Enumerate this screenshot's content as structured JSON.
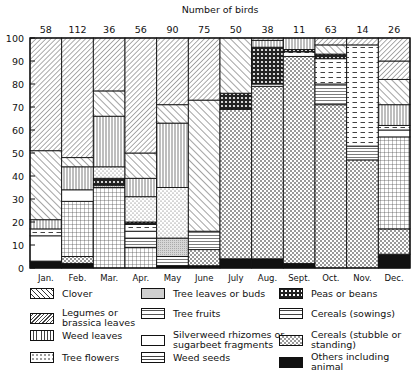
{
  "chart_data": {
    "type": "bar",
    "stacked": true,
    "title": "",
    "top_axis_label": "Number of birds",
    "xlabel": "",
    "ylabel": "",
    "ylim": [
      0,
      100
    ],
    "yticks": [
      0,
      10,
      20,
      30,
      40,
      50,
      60,
      70,
      80,
      90,
      100
    ],
    "grid": false,
    "legend_position": "bottom",
    "categories": [
      "Jan.",
      "Feb.",
      "Mar.",
      "Apr.",
      "May",
      "June",
      "July",
      "Aug.",
      "Sept.",
      "Oct.",
      "Nov.",
      "Dec."
    ],
    "bird_counts": [
      58,
      112,
      36,
      56,
      90,
      75,
      50,
      38,
      11,
      63,
      14,
      26
    ],
    "series": [
      {
        "name": "Others including animal",
        "pattern": "black",
        "values": [
          3,
          2,
          0,
          0,
          1,
          1,
          4,
          4,
          2,
          0,
          0,
          6
        ]
      },
      {
        "name": "Cereals (stubble or standing)",
        "pattern": "checker",
        "values": [
          0,
          3,
          0,
          0,
          0,
          7,
          65,
          75,
          90,
          71,
          47,
          11
        ]
      },
      {
        "name": "Cereals (sowings)",
        "pattern": "grid",
        "values": [
          0,
          24,
          35,
          9,
          0,
          0,
          0,
          0,
          0,
          0,
          0,
          40
        ]
      },
      {
        "name": "Weed seeds",
        "pattern": "hlines",
        "values": [
          0,
          0,
          0,
          4,
          4,
          8,
          0,
          0,
          0,
          9,
          6,
          0
        ]
      },
      {
        "name": "Silverweed rhizomes or sugarbeet fragments",
        "pattern": "white",
        "values": [
          11,
          5,
          0,
          3,
          0,
          0,
          0,
          0,
          0,
          0,
          0,
          3
        ]
      },
      {
        "name": "Tree fruits",
        "pattern": "dashes",
        "values": [
          3,
          0,
          0,
          3,
          0,
          0,
          0,
          1,
          2,
          11,
          44,
          2
        ]
      },
      {
        "name": "Tree leaves or buds",
        "pattern": "stipple-grey",
        "values": [
          0,
          0,
          1,
          0,
          8,
          0,
          0,
          0,
          0,
          0,
          0,
          0
        ]
      },
      {
        "name": "Peas or beans",
        "pattern": "dots-dark",
        "values": [
          0,
          0,
          3,
          1,
          0,
          0,
          7,
          16,
          1,
          2,
          0,
          0
        ]
      },
      {
        "name": "Tree flowers",
        "pattern": "dots",
        "values": [
          0,
          0,
          5,
          11,
          22,
          0,
          0,
          0,
          0,
          0,
          0,
          0
        ]
      },
      {
        "name": "Weed leaves",
        "pattern": "vlines",
        "values": [
          4,
          10,
          22,
          8,
          28,
          0,
          0,
          3,
          5,
          0,
          0,
          9
        ]
      },
      {
        "name": "Clover",
        "pattern": "backslash",
        "values": [
          30,
          4,
          11,
          11,
          8,
          57,
          24,
          0,
          0,
          4,
          0,
          11
        ]
      },
      {
        "name": "Legumes or brassica leaves",
        "pattern": "slash",
        "values": [
          49,
          52,
          23,
          50,
          29,
          27,
          0,
          1,
          0,
          3,
          3,
          8
        ]
      }
    ]
  },
  "legend": [
    {
      "label": "Clover",
      "pattern": "backslash"
    },
    {
      "label": "Legumes or\nbrassica leaves",
      "pattern": "slash"
    },
    {
      "label": "Weed leaves",
      "pattern": "vlines"
    },
    {
      "label": "Tree flowers",
      "pattern": "dots"
    },
    {
      "label": "Tree leaves or buds",
      "pattern": "stipple-grey"
    },
    {
      "label": "Tree fruits",
      "pattern": "dashes"
    },
    {
      "label": "Silverweed rhizomes or\nsugarbeet fragments",
      "pattern": "white"
    },
    {
      "label": "Weed seeds",
      "pattern": "hlines"
    },
    {
      "label": "Peas or beans",
      "pattern": "dots-dark"
    },
    {
      "label": "Cereals (sowings)",
      "pattern": "grid"
    },
    {
      "label": "Cereals (stubble or\nstanding)",
      "pattern": "checker"
    },
    {
      "label": "Others including animal",
      "pattern": "black"
    }
  ]
}
